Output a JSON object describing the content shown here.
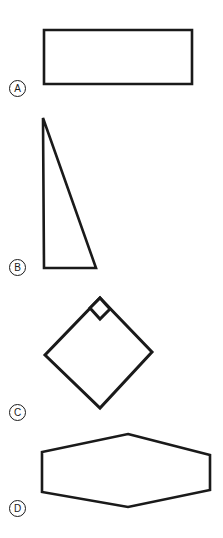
{
  "figure": {
    "background_color": "#ffffff",
    "stroke_color": "#1a1a1a",
    "fill_color": "#ffffff",
    "width": 223,
    "height": 538,
    "items": [
      {
        "label": "A",
        "shape_name": "rectangle",
        "stroke_width": 2.6,
        "points": "44,30 192,30 192,84 44,84",
        "right_angle_marker": false
      },
      {
        "label": "B",
        "shape_name": "triangle",
        "stroke_width": 2.6,
        "points": "43,118 96,268 44,268",
        "right_angle_marker": false
      },
      {
        "label": "C",
        "shape_name": "square-diamond",
        "stroke_width": 3.0,
        "points": "100,298 152,352 100,408 45,355",
        "right_angle_marker": true,
        "marker_points": "90,308 100,298 110,309 100,319"
      },
      {
        "label": "D",
        "shape_name": "hexagon",
        "stroke_width": 2.6,
        "points": "128,434 210,455 210,490 128,507 42,492 42,452",
        "right_angle_marker": false
      }
    ]
  }
}
